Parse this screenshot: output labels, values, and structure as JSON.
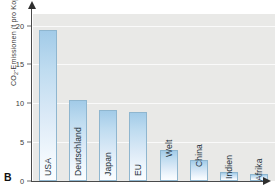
{
  "figure": {
    "letter": "B"
  },
  "chart_data": {
    "type": "bar",
    "title": "",
    "xlabel": "",
    "ylabel": "CO2-Emissionen (t pro Kopf)",
    "ylabel_parts": {
      "prefix": "CO",
      "subscript": "2",
      "suffix": "-Emissionen (t pro Kopf)"
    },
    "categories": [
      "USA",
      "Deutschland",
      "Japan",
      "EU",
      "Welt",
      "China",
      "Indien",
      "Afrika"
    ],
    "values": [
      19.5,
      10.4,
      9.1,
      8.9,
      4.0,
      2.7,
      1.2,
      0.9
    ],
    "ylim": [
      0,
      21.5
    ],
    "yticks": [
      0,
      5,
      10,
      15,
      20
    ],
    "ytick_labels": [
      "0",
      "5",
      "10",
      "15",
      "20"
    ],
    "grid": true,
    "legend": null,
    "colors": {
      "bar_top": "#a2cbe8",
      "bar_bottom": "#fbfdff",
      "bar_border": "#8fb6cf",
      "plot_background": "#e9e9e7",
      "gridline": "#ffffff",
      "axis": "#4a4a4a",
      "text": "#25323c"
    }
  }
}
